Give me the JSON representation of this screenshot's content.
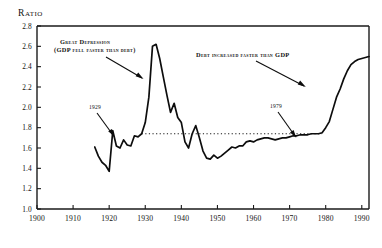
{
  "figure": {
    "axis_title": "Ratio",
    "background": "#ffffff",
    "ink_color": "#0d0d0d"
  },
  "annotations": {
    "great_depression_line1": "Great Depression",
    "great_depression_line2": "(GDP fell faster than debt)",
    "debt_faster": "Debt increased faster than GDP",
    "year_marker_left": "1929",
    "year_marker_right": "1979"
  },
  "chart_data": {
    "type": "line",
    "title": "Ratio",
    "xlabel": "",
    "ylabel": "Ratio",
    "xlim": [
      1900,
      1992
    ],
    "ylim": [
      1.0,
      2.8
    ],
    "xticks": [
      1900,
      1910,
      1920,
      1930,
      1940,
      1950,
      1960,
      1970,
      1980,
      1990
    ],
    "yticks": [
      1.0,
      1.2,
      1.4,
      1.6,
      1.8,
      2.0,
      2.2,
      2.4,
      2.6,
      2.8
    ],
    "xtick_labels": [
      "1900",
      "1910",
      "1920",
      "1930",
      "1940",
      "1950",
      "1960",
      "1970",
      "1980",
      "1990"
    ],
    "ytick_labels": [
      "1.0",
      "1.2",
      "1.4",
      "1.6",
      "1.8",
      "2.0",
      "2.2",
      "2.4",
      "2.6",
      "2.8"
    ],
    "grid": false,
    "legend": null,
    "reference_line": {
      "type": "horizontal",
      "y": 1.74,
      "x_start": 1929,
      "x_end": 1979,
      "style": "dotted"
    },
    "series": [
      {
        "name": "Total debt to GDP ratio",
        "x": [
          1916,
          1917,
          1918,
          1919,
          1920,
          1921,
          1922,
          1923,
          1924,
          1925,
          1926,
          1927,
          1928,
          1929,
          1930,
          1931,
          1932,
          1933,
          1934,
          1935,
          1936,
          1937,
          1938,
          1939,
          1940,
          1941,
          1942,
          1943,
          1944,
          1945,
          1946,
          1947,
          1948,
          1949,
          1950,
          1951,
          1952,
          1953,
          1954,
          1955,
          1956,
          1957,
          1958,
          1959,
          1960,
          1961,
          1962,
          1963,
          1964,
          1965,
          1966,
          1967,
          1968,
          1969,
          1970,
          1971,
          1972,
          1973,
          1974,
          1975,
          1976,
          1977,
          1978,
          1979,
          1980,
          1981,
          1982,
          1983,
          1984,
          1985,
          1986,
          1987,
          1988,
          1989,
          1990,
          1991,
          1992
        ],
        "y": [
          1.61,
          1.52,
          1.46,
          1.43,
          1.37,
          1.77,
          1.62,
          1.6,
          1.68,
          1.63,
          1.62,
          1.72,
          1.71,
          1.74,
          1.85,
          2.1,
          2.6,
          2.62,
          2.48,
          2.3,
          2.12,
          1.95,
          2.04,
          1.9,
          1.85,
          1.66,
          1.6,
          1.74,
          1.82,
          1.7,
          1.57,
          1.5,
          1.49,
          1.53,
          1.5,
          1.52,
          1.55,
          1.58,
          1.61,
          1.6,
          1.62,
          1.62,
          1.66,
          1.67,
          1.66,
          1.68,
          1.69,
          1.7,
          1.7,
          1.69,
          1.68,
          1.69,
          1.7,
          1.7,
          1.71,
          1.72,
          1.72,
          1.73,
          1.73,
          1.73,
          1.74,
          1.74,
          1.74,
          1.75,
          1.8,
          1.86,
          1.98,
          2.1,
          2.18,
          2.28,
          2.36,
          2.42,
          2.45,
          2.47,
          2.48,
          2.49,
          2.5
        ]
      }
    ]
  }
}
